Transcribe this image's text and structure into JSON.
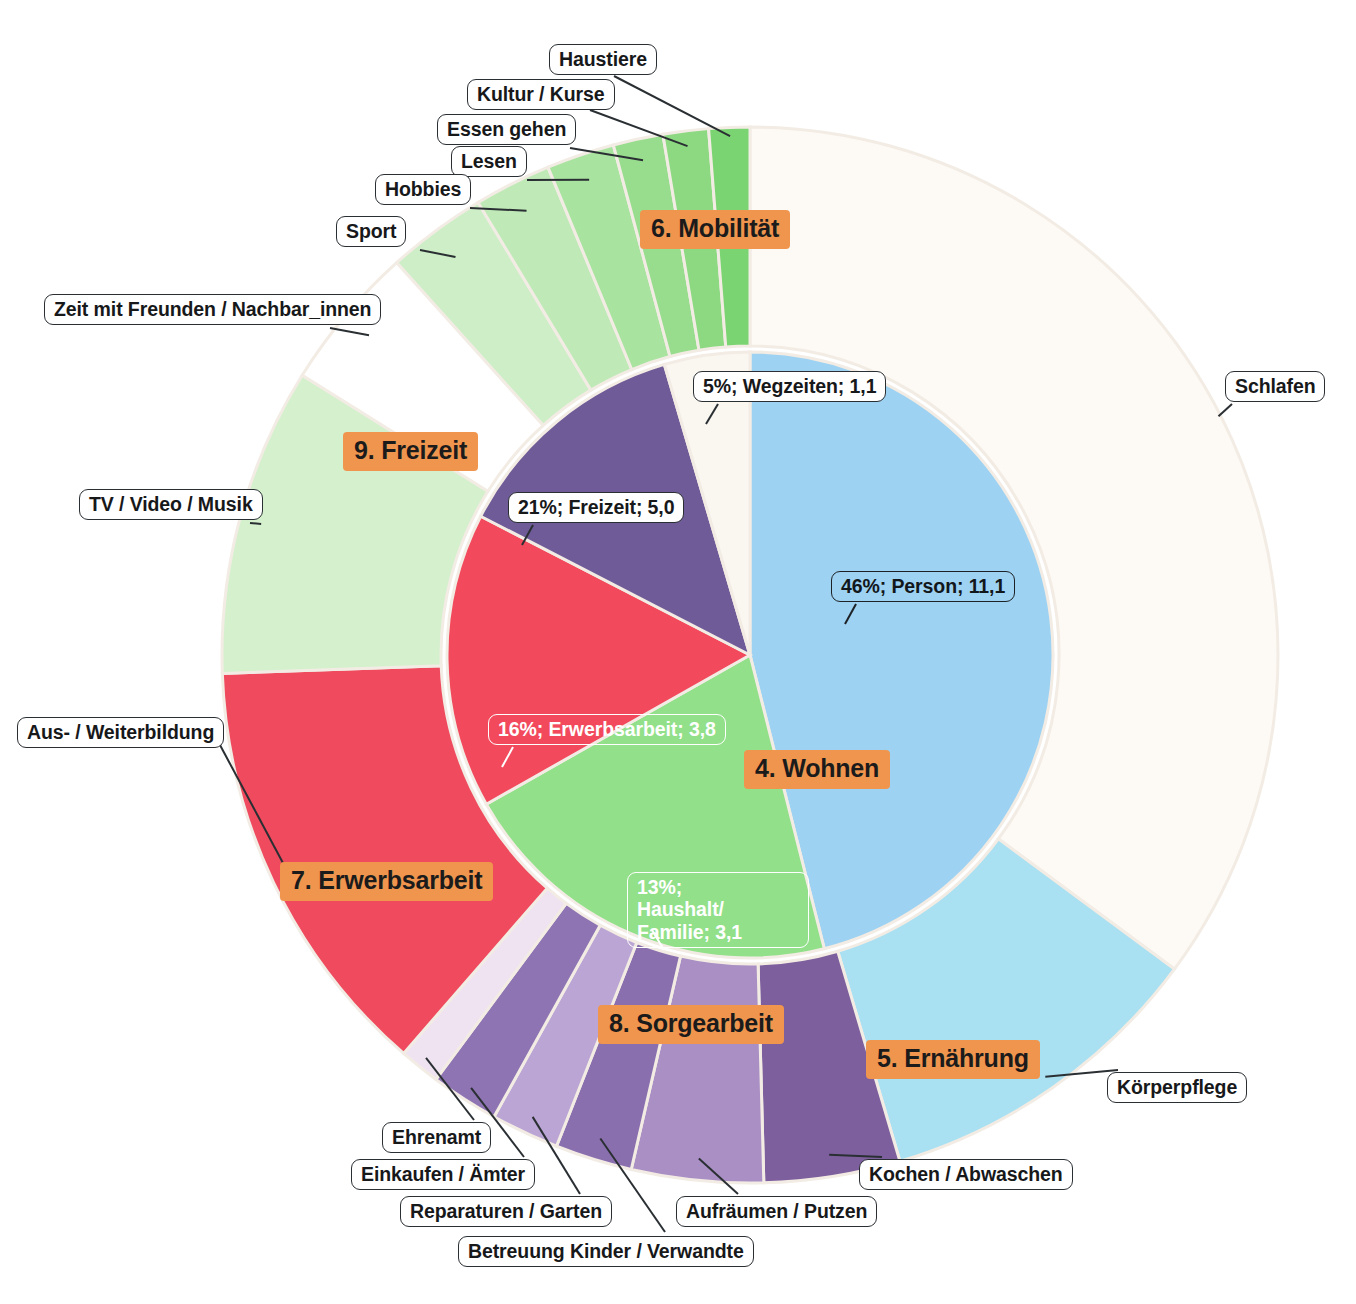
{
  "figure": {
    "type": "sunburst",
    "center_x": 750,
    "center_y": 655,
    "inner_radius": 303,
    "outer_radius": 528,
    "accent_badge_color": "#f0954e",
    "outline_color": "#f2ece4"
  },
  "chart_data": {
    "type": "pie",
    "title": "",
    "subtitle": "",
    "xlabel": "",
    "ylabel": "",
    "legend_position": "none",
    "units": "Stunden pro Tag",
    "inner_ring": {
      "name": "Hauptkategorien",
      "categories": [
        "Person",
        "Freizeit",
        "Erwerbsarbeit",
        "Haushalt/ Familie",
        "Wegzeiten"
      ],
      "values": [
        11.1,
        5.0,
        3.8,
        3.1,
        1.1
      ],
      "percent": [
        46,
        21,
        16,
        13,
        5
      ],
      "labels": [
        "46%; Person; 11,1",
        "21%; Freizeit; 5,0",
        "16%; Erwerbsarbeit; 3,8",
        "13%; Haushalt/ Familie; 3,1",
        "5%; Wegzeiten; 1,1"
      ],
      "colors": [
        "#9ed2f2",
        "#92e08a",
        "#f2495c",
        "#6f5b97",
        "#faf6f0"
      ]
    },
    "outer_ring": {
      "name": "Unterkategorien",
      "categories": [
        "Schlafen",
        "Körperpflege",
        "Kochen / Abwaschen",
        "Aufräumen / Putzen",
        "Betreuung Kinder / Verwandte",
        "Reparaturen / Garten",
        "Einkaufen / Ämter",
        "Ehrenamt",
        "Aus- / Weiterbildung",
        "TV / Video / Musik",
        "Zeit mit Freunden / Nachbar_innen",
        "Sport",
        "Hobbies",
        "Lesen",
        "Essen gehen",
        "Kultur / Kurse",
        "Haustiere"
      ],
      "colors": [
        "#fdfaf5",
        "#a9e0f2",
        "#7d5f9d",
        "#a98fc4",
        "#8a6fae",
        "#bba5d4",
        "#8e74b2",
        "#efe3f2",
        "#ef4a5e",
        "#d4f0cd",
        "#ffffff",
        "#cdeec6",
        "#bfeab7",
        "#a9e3a0",
        "#97dd8d",
        "#8cd982",
        "#7bd472"
      ]
    },
    "group_badges": [
      "4. Wohnen",
      "5. Ernährung",
      "6. Mobilität",
      "7. Erwerbsarbeit",
      "8. Sorgearbeit",
      "9. Freizeit"
    ]
  },
  "callouts": {
    "inner": [
      {
        "text": "46%; Person; 11,1"
      },
      {
        "text": "21%; Freizeit; 5,0"
      },
      {
        "text": "16%; Erwerbsarbeit; 3,8"
      },
      {
        "text": "13%;\nHaushalt/ Familie; 3,1"
      },
      {
        "text": "5%; Wegzeiten; 1,1"
      }
    ],
    "haushalt_line1": "13%;",
    "haushalt_line2": "Haushalt/ Familie; 3,1",
    "outer": [
      {
        "text": "Haustiere"
      },
      {
        "text": "Kultur / Kurse"
      },
      {
        "text": "Essen gehen"
      },
      {
        "text": "Lesen"
      },
      {
        "text": "Hobbies"
      },
      {
        "text": "Sport"
      },
      {
        "text": "Zeit mit Freunden / Nachbar_innen"
      },
      {
        "text": "TV / Video / Musik"
      },
      {
        "text": "Aus- / Weiterbildung"
      },
      {
        "text": "Ehrenamt"
      },
      {
        "text": "Einkaufen / Ämter"
      },
      {
        "text": "Reparaturen / Garten"
      },
      {
        "text": "Betreuung Kinder / Verwandte"
      },
      {
        "text": "Aufräumen / Putzen"
      },
      {
        "text": "Kochen / Abwaschen"
      },
      {
        "text": "Körperpflege"
      },
      {
        "text": "Schlafen"
      }
    ]
  },
  "badges": [
    {
      "label": "6. Mobilität"
    },
    {
      "label": "9. Freizeit"
    },
    {
      "label": "4. Wohnen"
    },
    {
      "label": "7. Erwerbsarbeit"
    },
    {
      "label": "8. Sorgearbeit"
    },
    {
      "label": "5. Ernährung"
    }
  ],
  "footer": {
    "note": ""
  }
}
